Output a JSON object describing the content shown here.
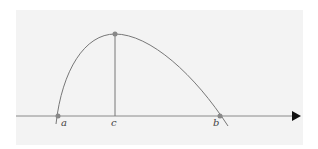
{
  "diagram": {
    "axis": {
      "direction": "x",
      "arrow": "right"
    },
    "points": [
      {
        "id": "a",
        "label": "a",
        "x": 58,
        "y": 116
      },
      {
        "id": "c",
        "label": "c",
        "x": 115,
        "y": 34
      },
      {
        "id": "b",
        "label": "b",
        "x": 220,
        "y": 116
      }
    ],
    "colors": {
      "curve": "#777777",
      "axis": "#8a8a8a",
      "point": "#888888",
      "arrow": "#111111",
      "background": "#f3f3f3"
    }
  }
}
